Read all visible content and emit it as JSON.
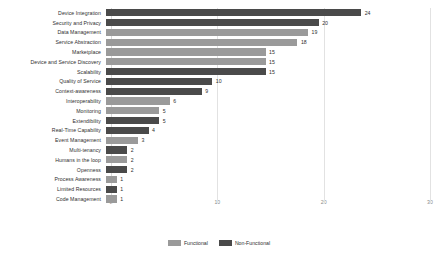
{
  "chart_data": {
    "type": "bar",
    "orientation": "horizontal",
    "title": "",
    "subtitle": "",
    "xlabel": "",
    "ylabel": "",
    "xlim": [
      0,
      30
    ],
    "xticks": [
      0,
      10,
      20,
      30
    ],
    "xtick_labels": [
      "0",
      "10",
      "20",
      "30"
    ],
    "grid": true,
    "grid_axis": "x",
    "legend_position": "bottom-center",
    "show_value_labels": true,
    "categories": [
      "Device Integration",
      "Security and Privacy",
      "Data Management",
      "Service Abstraction",
      "Marketplace",
      "Device and Service Discovery",
      "Scalability",
      "Quality of Service",
      "Context-awareness",
      "Interoperability",
      "Monitoring",
      "Extendibility",
      "Real-Time Capability",
      "Event Management",
      "Multi-tenancy",
      "Humans in the loop",
      "Openness",
      "Process Awareness",
      "Limited Resources",
      "Code Management"
    ],
    "values": [
      24,
      20,
      19,
      18,
      15,
      15,
      15,
      10,
      9,
      6,
      5,
      5,
      4,
      3,
      2,
      2,
      2,
      1,
      1,
      1
    ],
    "groups": [
      "Non-Functional",
      "Non-Functional",
      "Functional",
      "Functional",
      "Functional",
      "Functional",
      "Non-Functional",
      "Non-Functional",
      "Non-Functional",
      "Functional",
      "Functional",
      "Non-Functional",
      "Non-Functional",
      "Functional",
      "Non-Functional",
      "Functional",
      "Non-Functional",
      "Functional",
      "Non-Functional",
      "Functional"
    ],
    "legend": [
      {
        "label": "Functional",
        "color": "#9a9a9a"
      },
      {
        "label": "Non-Functional",
        "color": "#4a4a4a"
      }
    ],
    "colors": {
      "functional": "#9a9a9a",
      "nonfunctional": "#4a4a4a",
      "gridline": "#e2e2e2",
      "text": "#2f2f2f",
      "axis_text": "#8a8a8a",
      "background": "#ffffff"
    }
  }
}
